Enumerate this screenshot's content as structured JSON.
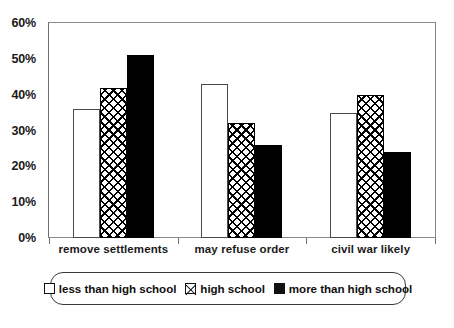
{
  "chart_data": {
    "type": "bar",
    "title": "",
    "subtitle": "",
    "xlabel": "",
    "ylabel": "",
    "categories": [
      "remove settlements",
      "may refuse order",
      "civil war likely"
    ],
    "series": [
      {
        "name": "less than high school",
        "pattern": "open",
        "values": [
          36,
          43,
          35
        ]
      },
      {
        "name": "high school",
        "pattern": "hatch",
        "values": [
          42,
          32,
          40
        ]
      },
      {
        "name": "more than high school",
        "pattern": "solid",
        "values": [
          51,
          26,
          24
        ]
      }
    ],
    "ylim": [
      0,
      60
    ],
    "ytick_values": [
      0,
      10,
      20,
      30,
      40,
      50,
      60
    ],
    "ytick_labels": [
      "0%",
      "10%",
      "20%",
      "30%",
      "40%",
      "50%",
      "60%"
    ],
    "grid": false,
    "legend_position": "bottom",
    "value_suffix": "%"
  },
  "legend": {
    "entries": [
      {
        "label": "less than high school",
        "pattern": "open"
      },
      {
        "label": "high school",
        "pattern": "hatch"
      },
      {
        "label": "more than high school",
        "pattern": "solid"
      }
    ]
  },
  "colors": {
    "bar_fill_solid": "#000000",
    "bar_outline": "#000000",
    "bar_fill_open": "#ffffff",
    "axis": "#6e6e6e",
    "text": "#1a1a1a",
    "background": "#ffffff"
  }
}
